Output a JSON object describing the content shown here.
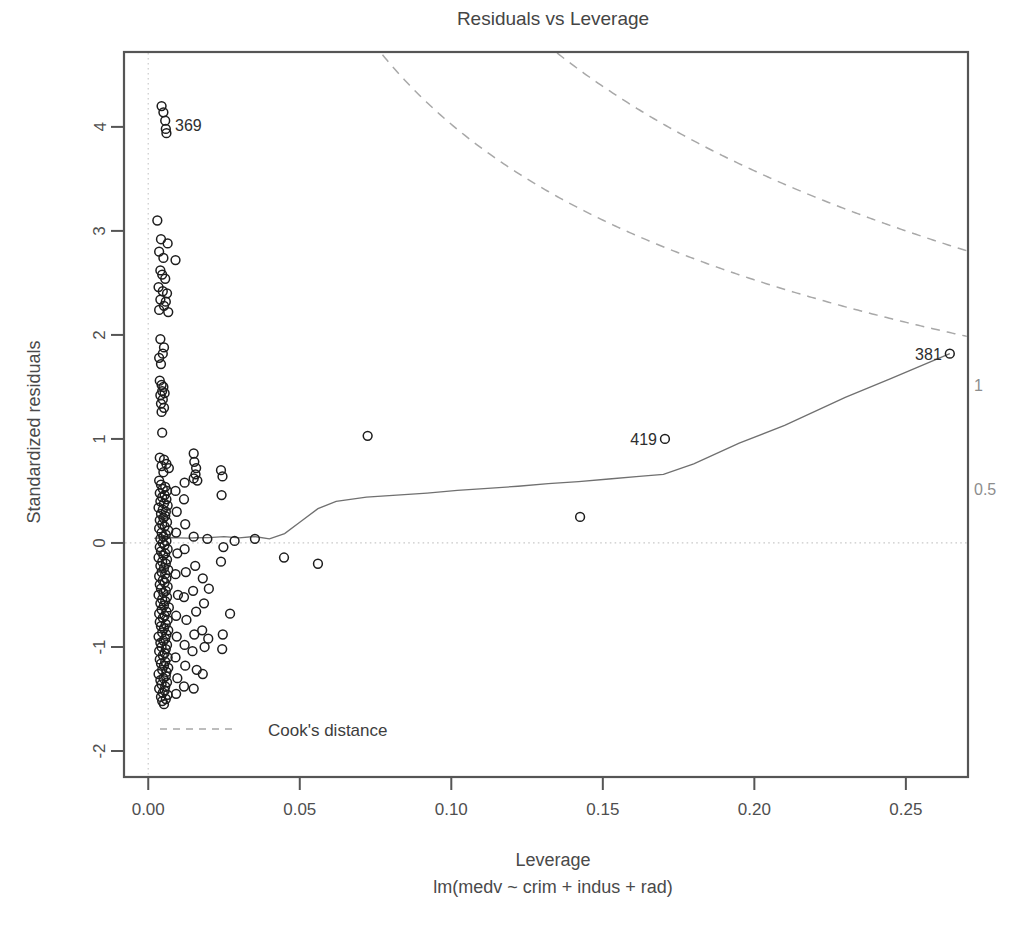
{
  "chart_data": {
    "type": "scatter",
    "title": "Residuals vs Leverage",
    "xlabel": "Leverage",
    "sublabel": "lm(medv ~ crim + indus + rad)",
    "ylabel": "Standardized residuals",
    "xlim": [
      -0.008,
      0.2705
    ],
    "ylim": [
      -2.25,
      4.72
    ],
    "xticks": [
      0.0,
      0.05,
      0.1,
      0.15,
      0.2,
      0.25
    ],
    "xtick_labels": [
      "0.00",
      "0.05",
      "0.10",
      "0.15",
      "0.20",
      "0.25"
    ],
    "yticks": [
      -2,
      -1,
      0,
      1,
      2,
      3,
      4
    ],
    "ytick_labels": [
      "-2",
      "-1",
      "0",
      "1",
      "2",
      "3",
      "4"
    ],
    "grid": false,
    "legend_position": "bottom-left",
    "legend": [
      {
        "label": "Cook's distance",
        "style": "dashed",
        "color": "#a8a8a8"
      }
    ],
    "reference_lines": [
      {
        "orientation": "horizontal",
        "value": 0,
        "style": "dotted",
        "color": "#c9c9c9"
      },
      {
        "orientation": "vertical",
        "value": 0.0,
        "style": "dotted",
        "color": "#cfcfcf"
      }
    ],
    "annotations": [
      {
        "label": "369",
        "x": 0.0062,
        "y": 4.02,
        "placement": "right"
      },
      {
        "label": "419",
        "x": 0.1705,
        "y": 1.0,
        "placement": "left"
      },
      {
        "label": "381",
        "x": 0.2645,
        "y": 1.82,
        "placement": "left"
      }
    ],
    "cook_contours": [
      {
        "level": "1",
        "label": "1",
        "label_x": 0.2705,
        "label_y": 1.52
      },
      {
        "level": "0.5",
        "label": "0.5",
        "label_x": 0.2705,
        "label_y": 0.52
      }
    ],
    "smoother": {
      "name": "loess",
      "color": "#707070",
      "x": [
        0.002,
        0.004,
        0.006,
        0.008,
        0.01,
        0.013,
        0.016,
        0.02,
        0.025,
        0.03,
        0.035,
        0.04,
        0.045,
        0.05,
        0.056,
        0.062,
        0.072,
        0.082,
        0.092,
        0.102,
        0.112,
        0.122,
        0.132,
        0.142,
        0.152,
        0.162,
        0.17,
        0.18,
        0.195,
        0.21,
        0.23,
        0.245,
        0.2645
      ],
      "y": [
        0.045,
        0.05,
        0.052,
        0.05,
        0.048,
        0.046,
        0.05,
        0.052,
        0.06,
        0.048,
        0.062,
        0.04,
        0.09,
        0.2,
        0.33,
        0.4,
        0.44,
        0.46,
        0.48,
        0.505,
        0.525,
        0.545,
        0.57,
        0.59,
        0.615,
        0.64,
        0.66,
        0.76,
        0.96,
        1.13,
        1.4,
        1.58,
        1.82
      ]
    },
    "points": [
      {
        "x": 0.0044,
        "y": 4.2
      },
      {
        "x": 0.005,
        "y": 4.14
      },
      {
        "x": 0.0056,
        "y": 4.06
      },
      {
        "x": 0.0058,
        "y": 3.98
      },
      {
        "x": 0.006,
        "y": 3.94
      },
      {
        "x": 0.003,
        "y": 3.1
      },
      {
        "x": 0.0042,
        "y": 2.92
      },
      {
        "x": 0.0064,
        "y": 2.88
      },
      {
        "x": 0.0036,
        "y": 2.8
      },
      {
        "x": 0.005,
        "y": 2.74
      },
      {
        "x": 0.009,
        "y": 2.72
      },
      {
        "x": 0.004,
        "y": 2.62
      },
      {
        "x": 0.0046,
        "y": 2.58
      },
      {
        "x": 0.0056,
        "y": 2.54
      },
      {
        "x": 0.0034,
        "y": 2.46
      },
      {
        "x": 0.0048,
        "y": 2.42
      },
      {
        "x": 0.0062,
        "y": 2.4
      },
      {
        "x": 0.004,
        "y": 2.34
      },
      {
        "x": 0.0058,
        "y": 2.32
      },
      {
        "x": 0.0052,
        "y": 2.28
      },
      {
        "x": 0.0036,
        "y": 2.24
      },
      {
        "x": 0.0066,
        "y": 2.22
      },
      {
        "x": 0.004,
        "y": 1.96
      },
      {
        "x": 0.0052,
        "y": 1.88
      },
      {
        "x": 0.0048,
        "y": 1.82
      },
      {
        "x": 0.0036,
        "y": 1.78
      },
      {
        "x": 0.0042,
        "y": 1.72
      },
      {
        "x": 0.0038,
        "y": 1.56
      },
      {
        "x": 0.0044,
        "y": 1.52
      },
      {
        "x": 0.005,
        "y": 1.5
      },
      {
        "x": 0.0046,
        "y": 1.46
      },
      {
        "x": 0.0054,
        "y": 1.44
      },
      {
        "x": 0.004,
        "y": 1.42
      },
      {
        "x": 0.0048,
        "y": 1.38
      },
      {
        "x": 0.0042,
        "y": 1.34
      },
      {
        "x": 0.0052,
        "y": 1.3
      },
      {
        "x": 0.0044,
        "y": 1.26
      },
      {
        "x": 0.0046,
        "y": 1.06
      },
      {
        "x": 0.0724,
        "y": 1.03
      },
      {
        "x": 0.1705,
        "y": 1.0
      },
      {
        "x": 0.2645,
        "y": 1.82
      },
      {
        "x": 0.0038,
        "y": 0.82
      },
      {
        "x": 0.0052,
        "y": 0.8
      },
      {
        "x": 0.006,
        "y": 0.76
      },
      {
        "x": 0.0044,
        "y": 0.74
      },
      {
        "x": 0.0068,
        "y": 0.72
      },
      {
        "x": 0.005,
        "y": 0.68
      },
      {
        "x": 0.015,
        "y": 0.86
      },
      {
        "x": 0.0152,
        "y": 0.78
      },
      {
        "x": 0.0158,
        "y": 0.72
      },
      {
        "x": 0.0156,
        "y": 0.66
      },
      {
        "x": 0.015,
        "y": 0.62
      },
      {
        "x": 0.0162,
        "y": 0.6
      },
      {
        "x": 0.012,
        "y": 0.58
      },
      {
        "x": 0.0036,
        "y": 0.6
      },
      {
        "x": 0.0042,
        "y": 0.56
      },
      {
        "x": 0.0056,
        "y": 0.54
      },
      {
        "x": 0.0048,
        "y": 0.52
      },
      {
        "x": 0.0062,
        "y": 0.5
      },
      {
        "x": 0.0038,
        "y": 0.48
      },
      {
        "x": 0.0054,
        "y": 0.46
      },
      {
        "x": 0.0046,
        "y": 0.44
      },
      {
        "x": 0.006,
        "y": 0.42
      },
      {
        "x": 0.004,
        "y": 0.4
      },
      {
        "x": 0.0052,
        "y": 0.38
      },
      {
        "x": 0.0064,
        "y": 0.36
      },
      {
        "x": 0.0034,
        "y": 0.34
      },
      {
        "x": 0.0048,
        "y": 0.32
      },
      {
        "x": 0.0058,
        "y": 0.3
      },
      {
        "x": 0.0042,
        "y": 0.28
      },
      {
        "x": 0.0056,
        "y": 0.26
      },
      {
        "x": 0.005,
        "y": 0.24
      },
      {
        "x": 0.0038,
        "y": 0.22
      },
      {
        "x": 0.0062,
        "y": 0.2
      },
      {
        "x": 0.0046,
        "y": 0.18
      },
      {
        "x": 0.0054,
        "y": 0.16
      },
      {
        "x": 0.0036,
        "y": 0.14
      },
      {
        "x": 0.0066,
        "y": 0.12
      },
      {
        "x": 0.0044,
        "y": 0.1
      },
      {
        "x": 0.0058,
        "y": 0.08
      },
      {
        "x": 0.005,
        "y": 0.06
      },
      {
        "x": 0.004,
        "y": 0.04
      },
      {
        "x": 0.006,
        "y": 0.02
      },
      {
        "x": 0.0048,
        "y": 0.0
      },
      {
        "x": 0.0054,
        "y": -0.02
      },
      {
        "x": 0.0038,
        "y": -0.04
      },
      {
        "x": 0.0064,
        "y": -0.06
      },
      {
        "x": 0.0042,
        "y": -0.08
      },
      {
        "x": 0.0056,
        "y": -0.1
      },
      {
        "x": 0.005,
        "y": -0.12
      },
      {
        "x": 0.0034,
        "y": -0.14
      },
      {
        "x": 0.0062,
        "y": -0.16
      },
      {
        "x": 0.0046,
        "y": -0.18
      },
      {
        "x": 0.0058,
        "y": -0.2
      },
      {
        "x": 0.004,
        "y": -0.22
      },
      {
        "x": 0.0052,
        "y": -0.24
      },
      {
        "x": 0.0066,
        "y": -0.26
      },
      {
        "x": 0.0044,
        "y": -0.28
      },
      {
        "x": 0.0056,
        "y": -0.3
      },
      {
        "x": 0.0036,
        "y": -0.32
      },
      {
        "x": 0.006,
        "y": -0.34
      },
      {
        "x": 0.0048,
        "y": -0.36
      },
      {
        "x": 0.0054,
        "y": -0.38
      },
      {
        "x": 0.0038,
        "y": -0.4
      },
      {
        "x": 0.0064,
        "y": -0.42
      },
      {
        "x": 0.0042,
        "y": -0.44
      },
      {
        "x": 0.0058,
        "y": -0.46
      },
      {
        "x": 0.005,
        "y": -0.48
      },
      {
        "x": 0.0034,
        "y": -0.5
      },
      {
        "x": 0.0062,
        "y": -0.52
      },
      {
        "x": 0.0046,
        "y": -0.54
      },
      {
        "x": 0.0056,
        "y": -0.56
      },
      {
        "x": 0.004,
        "y": -0.58
      },
      {
        "x": 0.0052,
        "y": -0.6
      },
      {
        "x": 0.0068,
        "y": -0.62
      },
      {
        "x": 0.0044,
        "y": -0.64
      },
      {
        "x": 0.006,
        "y": -0.66
      },
      {
        "x": 0.0036,
        "y": -0.68
      },
      {
        "x": 0.0054,
        "y": -0.7
      },
      {
        "x": 0.0048,
        "y": -0.72
      },
      {
        "x": 0.0064,
        "y": -0.74
      },
      {
        "x": 0.0038,
        "y": -0.76
      },
      {
        "x": 0.0058,
        "y": -0.78
      },
      {
        "x": 0.0042,
        "y": -0.8
      },
      {
        "x": 0.0052,
        "y": -0.82
      },
      {
        "x": 0.0066,
        "y": -0.84
      },
      {
        "x": 0.0046,
        "y": -0.86
      },
      {
        "x": 0.006,
        "y": -0.88
      },
      {
        "x": 0.0034,
        "y": -0.9
      },
      {
        "x": 0.0056,
        "y": -0.92
      },
      {
        "x": 0.005,
        "y": -0.94
      },
      {
        "x": 0.004,
        "y": -0.96
      },
      {
        "x": 0.0062,
        "y": -0.98
      },
      {
        "x": 0.0044,
        "y": -1.0
      },
      {
        "x": 0.0058,
        "y": -1.02
      },
      {
        "x": 0.0036,
        "y": -1.04
      },
      {
        "x": 0.0054,
        "y": -1.06
      },
      {
        "x": 0.0048,
        "y": -1.08
      },
      {
        "x": 0.0064,
        "y": -1.1
      },
      {
        "x": 0.0038,
        "y": -1.12
      },
      {
        "x": 0.0056,
        "y": -1.14
      },
      {
        "x": 0.0042,
        "y": -1.16
      },
      {
        "x": 0.0052,
        "y": -1.18
      },
      {
        "x": 0.0066,
        "y": -1.2
      },
      {
        "x": 0.0046,
        "y": -1.22
      },
      {
        "x": 0.006,
        "y": -1.24
      },
      {
        "x": 0.0034,
        "y": -1.26
      },
      {
        "x": 0.0058,
        "y": -1.28
      },
      {
        "x": 0.005,
        "y": -1.3
      },
      {
        "x": 0.004,
        "y": -1.32
      },
      {
        "x": 0.0062,
        "y": -1.34
      },
      {
        "x": 0.0044,
        "y": -1.36
      },
      {
        "x": 0.0056,
        "y": -1.38
      },
      {
        "x": 0.0036,
        "y": -1.4
      },
      {
        "x": 0.0054,
        "y": -1.42
      },
      {
        "x": 0.0048,
        "y": -1.44
      },
      {
        "x": 0.0064,
        "y": -1.46
      },
      {
        "x": 0.0042,
        "y": -1.48
      },
      {
        "x": 0.0058,
        "y": -1.5
      },
      {
        "x": 0.0046,
        "y": -1.52
      },
      {
        "x": 0.0052,
        "y": -1.55
      },
      {
        "x": 0.009,
        "y": 0.5
      },
      {
        "x": 0.0094,
        "y": 0.3
      },
      {
        "x": 0.0092,
        "y": 0.1
      },
      {
        "x": 0.0096,
        "y": -0.1
      },
      {
        "x": 0.009,
        "y": -0.3
      },
      {
        "x": 0.0098,
        "y": -0.5
      },
      {
        "x": 0.0092,
        "y": -0.7
      },
      {
        "x": 0.0094,
        "y": -0.9
      },
      {
        "x": 0.009,
        "y": -1.1
      },
      {
        "x": 0.0096,
        "y": -1.3
      },
      {
        "x": 0.0092,
        "y": -1.45
      },
      {
        "x": 0.0118,
        "y": 0.42
      },
      {
        "x": 0.0122,
        "y": 0.18
      },
      {
        "x": 0.012,
        "y": -0.06
      },
      {
        "x": 0.0124,
        "y": -0.28
      },
      {
        "x": 0.0118,
        "y": -0.52
      },
      {
        "x": 0.0126,
        "y": -0.74
      },
      {
        "x": 0.012,
        "y": -0.98
      },
      {
        "x": 0.0122,
        "y": -1.18
      },
      {
        "x": 0.0118,
        "y": -1.38
      },
      {
        "x": 0.015,
        "y": 0.06
      },
      {
        "x": 0.0155,
        "y": -0.22
      },
      {
        "x": 0.0148,
        "y": -0.46
      },
      {
        "x": 0.0158,
        "y": -0.66
      },
      {
        "x": 0.0152,
        "y": -0.88
      },
      {
        "x": 0.0146,
        "y": -1.04
      },
      {
        "x": 0.016,
        "y": -1.22
      },
      {
        "x": 0.015,
        "y": -1.4
      },
      {
        "x": 0.018,
        "y": -0.34
      },
      {
        "x": 0.0184,
        "y": -0.58
      },
      {
        "x": 0.0178,
        "y": -0.84
      },
      {
        "x": 0.0186,
        "y": -1.0
      },
      {
        "x": 0.018,
        "y": -1.26
      },
      {
        "x": 0.0195,
        "y": 0.04
      },
      {
        "x": 0.02,
        "y": -0.44
      },
      {
        "x": 0.0198,
        "y": -0.92
      },
      {
        "x": 0.024,
        "y": 0.7
      },
      {
        "x": 0.0245,
        "y": 0.64
      },
      {
        "x": 0.0242,
        "y": 0.46
      },
      {
        "x": 0.0248,
        "y": -0.04
      },
      {
        "x": 0.024,
        "y": -0.18
      },
      {
        "x": 0.0246,
        "y": -0.88
      },
      {
        "x": 0.0244,
        "y": -1.02
      },
      {
        "x": 0.027,
        "y": -0.68
      },
      {
        "x": 0.0285,
        "y": 0.02
      },
      {
        "x": 0.0352,
        "y": 0.04
      },
      {
        "x": 0.0448,
        "y": -0.14
      },
      {
        "x": 0.056,
        "y": -0.2
      },
      {
        "x": 0.1425,
        "y": 0.25
      }
    ]
  }
}
